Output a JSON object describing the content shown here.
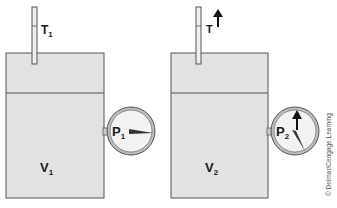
{
  "diagram": {
    "colors": {
      "container_fill": "#e2e2e2",
      "outline": "#555555",
      "gauge_face": "#f2f2f2",
      "text": "#1a1a1a"
    },
    "left_panel": {
      "temperature_label": "T",
      "temperature_sub": "1",
      "pressure_label": "P",
      "pressure_sub": "1",
      "volume_label": "V",
      "volume_sub": "1"
    },
    "right_panel": {
      "temperature_label": "T",
      "temperature_indicator": "increase-arrow",
      "pressure_label": "P",
      "pressure_sub": "2",
      "pressure_indicator": "increase-arrow",
      "volume_label": "V",
      "volume_sub": "2"
    },
    "credit": "© Delmar/Cengage Learning"
  }
}
